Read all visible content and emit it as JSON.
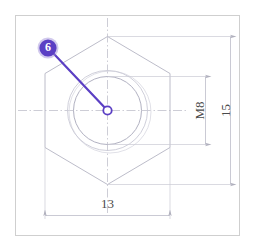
{
  "drawing": {
    "title": "Hex nut part detail view",
    "background_color": "#ffffff",
    "frame": {
      "name": "drawing-border",
      "stroke_color": "#cfcfcf",
      "x": 15,
      "y": 15,
      "width": 225,
      "height": 221
    },
    "part": {
      "name": "hex-nut",
      "outline_color": "#b9b9c6",
      "hexagon": {
        "center_x": 107,
        "center_y": 110,
        "across_flats": 13,
        "across_corners": 15,
        "orientation": "point-up"
      },
      "circles": [
        {
          "name": "thread-major-circle",
          "radius_px": 40,
          "color": "#c8c8d4"
        },
        {
          "name": "thread-minor-circle",
          "radius_px": 34,
          "color": "#a9a9bb"
        }
      ],
      "center_mark": {
        "name": "center-point",
        "color": "#5b3fc4",
        "radius_px": 4
      }
    },
    "centerlines": {
      "color": "#b5b5c2",
      "style": "dash-dot"
    },
    "dimensions": [
      {
        "id": "width-across-flats",
        "label": "13",
        "orientation": "horizontal",
        "position": "bottom",
        "unit": "mm"
      },
      {
        "id": "thread-size",
        "label": "M8",
        "orientation": "vertical",
        "position": "right-inner",
        "unit": ""
      },
      {
        "id": "width-across-corners",
        "label": "15",
        "orientation": "vertical",
        "position": "right-outer",
        "unit": "mm"
      }
    ],
    "callout": {
      "name": "callout-balloon-6",
      "label": "6",
      "fill_color": "#5b3fc4",
      "ring_color": "#9b8ad6",
      "text_color": "#ffffff",
      "leader_color": "#5b3fc4",
      "balloon_x": 48,
      "balloon_y": 48,
      "balloon_radius": 9,
      "leader_to_x": 107,
      "leader_to_y": 110
    }
  }
}
